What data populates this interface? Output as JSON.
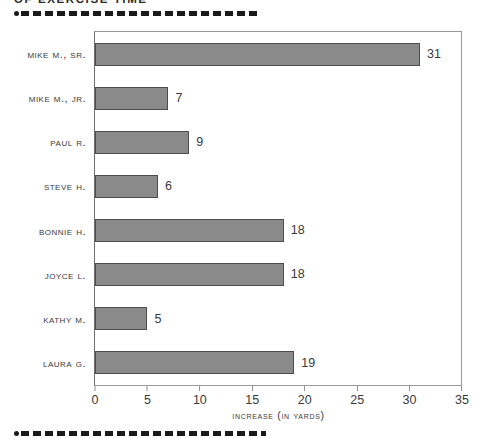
{
  "heading": "OF EXERCISE TIME",
  "decor": {
    "top_rule": "dashed-rule",
    "bottom_rule": "dashed-rule"
  },
  "chart_data": {
    "type": "bar",
    "orientation": "horizontal",
    "title": "",
    "categories": [
      "Mike M., Sr.",
      "Mike M., Jr.",
      "Paul R.",
      "Steve H.",
      "Bonnie H.",
      "Joyce L.",
      "Kathy M.",
      "Laura G."
    ],
    "values": [
      31,
      7,
      9,
      6,
      18,
      18,
      5,
      19
    ],
    "data_labels": [
      "31",
      "7",
      "9",
      "6",
      "18",
      "18",
      "5",
      "19"
    ],
    "xlabel": "Increase (in yards)",
    "ylabel": "",
    "xlim": [
      0,
      35
    ],
    "xticks": [
      0,
      5,
      10,
      15,
      20,
      25,
      30,
      35
    ],
    "xtick_labels": [
      "0",
      "5",
      "10",
      "15",
      "20",
      "25",
      "30",
      "35"
    ],
    "grid": false,
    "legend": false,
    "bar_color": "#8a8a8a",
    "bar_border_color": "#4d4d4d",
    "frame_color": "#9a9a9a",
    "background": "#ffffff"
  }
}
